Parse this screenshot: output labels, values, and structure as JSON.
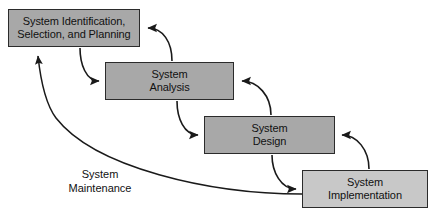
{
  "diagram": {
    "canvas": {
      "width": 437,
      "height": 217,
      "background": "#ffffff"
    },
    "colors": {
      "box_fill_dark": "#a8a8a8",
      "box_fill_light": "#c8c8c8",
      "box_border": "#2b2b2b",
      "arrow": "#1a1a1a",
      "text": "#111111",
      "background": "#ffffff"
    },
    "stages": [
      {
        "id": "identification",
        "label": "System Identification,\nSelection, and Planning",
        "fill": "#a8a8a8",
        "x": 8,
        "y": 9,
        "width": 132,
        "height": 38
      },
      {
        "id": "analysis",
        "label": "System\nAnalysis",
        "fill": "#a8a8a8",
        "x": 105,
        "y": 62,
        "width": 129,
        "height": 38
      },
      {
        "id": "design",
        "label": "System\nDesign",
        "fill": "#a8a8a8",
        "x": 204,
        "y": 116,
        "width": 131,
        "height": 38
      },
      {
        "id": "implementation",
        "label": "System\nImplementation",
        "fill": "#c8c8c8",
        "x": 302,
        "y": 170,
        "width": 126,
        "height": 38
      }
    ],
    "connectors": [
      {
        "id": "identification-to-analysis",
        "from": "identification",
        "to": "analysis",
        "direction": "forward"
      },
      {
        "id": "analysis-to-identification",
        "from": "analysis",
        "to": "identification",
        "direction": "feedback"
      },
      {
        "id": "analysis-to-design",
        "from": "analysis",
        "to": "design",
        "direction": "forward"
      },
      {
        "id": "design-to-analysis",
        "from": "design",
        "to": "analysis",
        "direction": "feedback"
      },
      {
        "id": "design-to-implementation",
        "from": "design",
        "to": "implementation",
        "direction": "forward"
      },
      {
        "id": "implementation-to-design",
        "from": "implementation",
        "to": "design",
        "direction": "feedback"
      },
      {
        "id": "implementation-to-identification",
        "from": "implementation",
        "to": "identification",
        "direction": "maintenance"
      }
    ],
    "flow_labels": [
      {
        "id": "system-maintenance",
        "text": "System\nMaintenance",
        "x": 55,
        "y": 167,
        "width": 90
      }
    ]
  }
}
